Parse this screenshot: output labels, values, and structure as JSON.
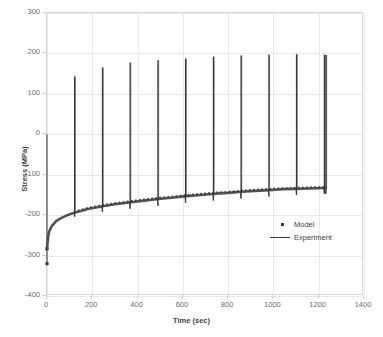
{
  "chart_data": {
    "type": "line",
    "title": "",
    "xlabel": "Time (sec)",
    "ylabel": "Stress (MPa)",
    "xlim": [
      0,
      1400
    ],
    "ylim": [
      -400,
      300
    ],
    "xticks": [
      0,
      200,
      400,
      600,
      800,
      1000,
      1200,
      1400
    ],
    "yticks": [
      300,
      200,
      100,
      0,
      -100,
      -200,
      -300,
      -400
    ],
    "grid": true,
    "legend_position": "center-right",
    "series": [
      {
        "name": "Model",
        "marker": "square",
        "color": "#3a3a3a"
      },
      {
        "name": "Experiment",
        "marker": "line",
        "color": "#3a3a3a"
      }
    ],
    "initial_drop": {
      "time": 0,
      "stress_min": -320,
      "stress_hold": -283
    },
    "relaxation_envelope": {
      "x": [
        0,
        5,
        10,
        20,
        40,
        60,
        90,
        120,
        180,
        245,
        300,
        370,
        430,
        490,
        550,
        615,
        680,
        740,
        800,
        860,
        920,
        980,
        1040,
        1100,
        1160,
        1230
      ],
      "y": [
        -283,
        -255,
        -240,
        -228,
        -215,
        -208,
        -200,
        -194,
        -185,
        -178,
        -173,
        -168,
        -164,
        -160,
        -157,
        -153,
        -150,
        -147,
        -145,
        -142,
        -140,
        -138,
        -136,
        -135,
        -134,
        -133
      ]
    },
    "spikes": [
      {
        "time": 122,
        "peak": 143,
        "base": -190
      },
      {
        "time": 245,
        "peak": 165,
        "base": -178
      },
      {
        "time": 367,
        "peak": 177,
        "base": -170
      },
      {
        "time": 490,
        "peak": 183,
        "base": -163
      },
      {
        "time": 612,
        "peak": 187,
        "base": -156
      },
      {
        "time": 735,
        "peak": 192,
        "base": -150
      },
      {
        "time": 857,
        "peak": 195,
        "base": -145
      },
      {
        "time": 980,
        "peak": 197,
        "base": -140
      },
      {
        "time": 1102,
        "peak": 198,
        "base": -136
      },
      {
        "time": 1225,
        "peak": 197,
        "base": -133
      },
      {
        "time": 1232,
        "peak": 196,
        "base": -133
      }
    ]
  },
  "axes": {
    "y_tick_labels": [
      "300",
      "200",
      "100",
      "0",
      "-100",
      "-200",
      "-300",
      "-400"
    ],
    "x_tick_labels": [
      "0",
      "200",
      "400",
      "600",
      "800",
      "1000",
      "1200",
      "1400"
    ],
    "y_title": "Stress (MPa)",
    "x_title": "Time (sec)"
  },
  "legend": {
    "items": [
      {
        "label": "Model",
        "key": "square-marker"
      },
      {
        "label": "Experiment",
        "key": "line-marker"
      }
    ]
  },
  "colors": {
    "data": "#3a3a3a",
    "grid": "#e8e8e8",
    "frame": "#d6d6d6",
    "text": "#6d6d6d",
    "title_text": "#3f3f3f",
    "background": "#ffffff"
  }
}
